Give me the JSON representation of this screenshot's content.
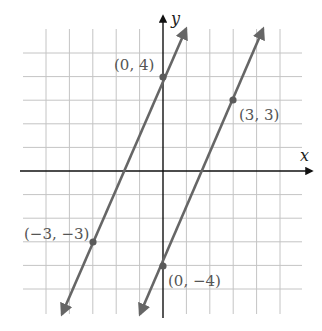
{
  "chart_data": {
    "type": "line",
    "title": "",
    "xlabel": "x",
    "ylabel": "y",
    "xlim": [
      -5,
      5
    ],
    "ylim": [
      -5,
      5
    ],
    "grid": true,
    "series": [
      {
        "name": "line-1",
        "equation": "y = (7/3)x + 4",
        "points": [
          {
            "x": 0,
            "y": 4,
            "label": "(0, 4)"
          },
          {
            "x": -3,
            "y": -3,
            "label": "(−3, −3)"
          }
        ]
      },
      {
        "name": "line-2",
        "equation": "y = (7/3)x - 4",
        "points": [
          {
            "x": 0,
            "y": -4,
            "label": "(0, −4)"
          },
          {
            "x": 3,
            "y": 3,
            "label": "(3, 3)"
          }
        ]
      }
    ]
  },
  "labels": {
    "x_axis": "x",
    "y_axis": "y",
    "p1": "(0, 4)",
    "p2": "(−3, −3)",
    "p3": "(3, 3)",
    "p4": "(0, −4)"
  },
  "colors": {
    "grid": "#c4c4c4",
    "axis": "#111111",
    "line": "#666666",
    "point": "#5a5a5a"
  }
}
